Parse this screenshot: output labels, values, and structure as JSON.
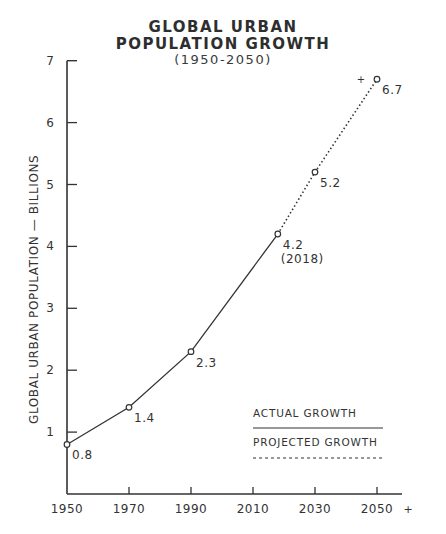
{
  "title_line1": "GLOBAL URBAN",
  "title_line2": "POPULATION GROWTH",
  "subtitle": "(1950-2050)",
  "chart_data": {
    "type": "line",
    "xlabel": "",
    "ylabel": "GLOBAL URBAN POPULATION — BILLIONS",
    "x_ticks": [
      "1950",
      "1970",
      "1990",
      "2010",
      "2030",
      "2050"
    ],
    "y_ticks": [
      "1",
      "2",
      "3",
      "4",
      "5",
      "6",
      "7"
    ],
    "xlim": [
      1950,
      2060
    ],
    "ylim": [
      0,
      7
    ],
    "grid": false,
    "legend_position": "lower right",
    "series": [
      {
        "name": "ACTUAL GROWTH",
        "style": "solid",
        "x": [
          1950,
          1970,
          1990,
          2018
        ],
        "values": [
          0.8,
          1.4,
          2.3,
          4.2
        ]
      },
      {
        "name": "PROJECTED GROWTH",
        "style": "dotted",
        "x": [
          2018,
          2030,
          2050
        ],
        "values": [
          4.2,
          5.2,
          6.7
        ]
      }
    ],
    "annotations": [
      {
        "x": 1950,
        "y": 0.8,
        "text": "0.8"
      },
      {
        "x": 1970,
        "y": 1.4,
        "text": "1.4"
      },
      {
        "x": 1990,
        "y": 2.3,
        "text": "2.3"
      },
      {
        "x": 2018,
        "y": 4.2,
        "text": "4.2",
        "sub": "(2018)"
      },
      {
        "x": 2030,
        "y": 5.2,
        "text": "5.2"
      },
      {
        "x": 2050,
        "y": 6.7,
        "text": "6.7"
      }
    ],
    "extra_marks": [
      "+",
      "+"
    ]
  }
}
